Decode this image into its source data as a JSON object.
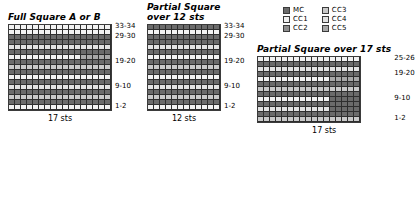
{
  "legend": {
    "name": "color-key",
    "items": [
      {
        "key": "MC",
        "label": "MC",
        "color": "#6b6b6b"
      },
      {
        "key": "CC3",
        "label": "CC3",
        "color": "#c9c9c9"
      },
      {
        "key": "CC1",
        "label": "CC1",
        "color": "#f2f2f2"
      },
      {
        "key": "CC4",
        "label": "CC4",
        "color": "#e3e3e3"
      },
      {
        "key": "CC2",
        "label": "CC2",
        "color": "#8f8f8f"
      },
      {
        "key": "CC5",
        "label": "CC5",
        "color": "#a8a8a8"
      }
    ]
  },
  "palette": {
    "MC": "#6b6b6b",
    "CC1": "#f2f2f2",
    "CC2": "#8f8f8f",
    "CC3": "#c9c9c9",
    "CC4": "#e3e3e3",
    "CC5": "#a8a8a8",
    "grid_line": "#2e2e2e",
    "border": "#3b3b3b",
    "background": "#ffffff"
  },
  "charts": [
    {
      "id": "full-square",
      "title": "Full Square A  or  B",
      "stitches_label": "17 sts",
      "stitch_count": 17,
      "row_count": 34,
      "row_labels": [
        {
          "text": "33-34",
          "row_from_top": 1
        },
        {
          "text": "29-30",
          "row_from_top": 3
        },
        {
          "text": "19-20",
          "row_from_top": 8
        },
        {
          "text": "9-10",
          "row_from_top": 13
        },
        {
          "text": "1-2",
          "row_from_top": 17
        }
      ],
      "rows": [
        [
          "CC1",
          "CC1",
          "CC1",
          "CC1",
          "CC1",
          "CC1",
          "CC1",
          "CC1",
          "CC1",
          "CC1",
          "CC1",
          "CC1",
          "CC1",
          "CC1",
          "CC1",
          "CC1",
          "CC1"
        ],
        [
          "CC1",
          "CC1",
          "CC1",
          "CC1",
          "CC1",
          "CC1",
          "CC1",
          "CC1",
          "CC1",
          "CC1",
          "CC1",
          "CC1",
          "CC1",
          "CC1",
          "CC1",
          "CC1",
          "CC1"
        ],
        [
          "MC",
          "MC",
          "MC",
          "MC",
          "MC",
          "MC",
          "MC",
          "MC",
          "MC",
          "MC",
          "MC",
          "MC",
          "MC",
          "MC",
          "MC",
          "MC",
          "MC"
        ],
        [
          "MC",
          "MC",
          "MC",
          "MC",
          "MC",
          "MC",
          "MC",
          "MC",
          "MC",
          "MC",
          "MC",
          "MC",
          "MC",
          "MC",
          "MC",
          "MC",
          "MC"
        ],
        [
          "CC4",
          "CC4",
          "CC4",
          "CC4",
          "CC4",
          "CC4",
          "CC4",
          "CC4",
          "CC4",
          "CC4",
          "CC4",
          "CC4",
          "CC4",
          "CC4",
          "CC4",
          "CC4",
          "CC4"
        ],
        [
          "MC",
          "MC",
          "MC",
          "MC",
          "MC",
          "MC",
          "MC",
          "MC",
          "MC",
          "MC",
          "MC",
          "MC",
          "MC",
          "MC",
          "MC",
          "MC",
          "MC"
        ],
        [
          "CC1",
          "CC1",
          "CC1",
          "CC1",
          "CC1",
          "CC1",
          "CC1",
          "CC1",
          "CC1",
          "CC1",
          "CC1",
          "CC1",
          "CC5",
          "CC5",
          "CC5",
          "CC5",
          "CC5"
        ],
        [
          "MC",
          "MC",
          "MC",
          "MC",
          "MC",
          "MC",
          "MC",
          "MC",
          "MC",
          "MC",
          "MC",
          "MC",
          "MC",
          "MC",
          "MC",
          "MC",
          "MC"
        ],
        [
          "CC3",
          "CC3",
          "CC3",
          "CC3",
          "CC3",
          "CC3",
          "CC3",
          "CC3",
          "CC3",
          "CC3",
          "CC3",
          "CC3",
          "CC3",
          "CC3",
          "CC3",
          "CC3",
          "CC3"
        ],
        [
          "MC",
          "MC",
          "MC",
          "MC",
          "MC",
          "MC",
          "MC",
          "MC",
          "MC",
          "MC",
          "MC",
          "MC",
          "MC",
          "MC",
          "MC",
          "MC",
          "MC"
        ],
        [
          "CC1",
          "CC1",
          "CC1",
          "CC1",
          "CC1",
          "CC1",
          "CC1",
          "CC1",
          "CC1",
          "CC1",
          "CC1",
          "CC1",
          "CC1",
          "CC1",
          "CC1",
          "CC1",
          "CC1"
        ],
        [
          "MC",
          "MC",
          "MC",
          "MC",
          "MC",
          "MC",
          "MC",
          "MC",
          "MC",
          "MC",
          "MC",
          "MC",
          "MC",
          "MC",
          "MC",
          "MC",
          "MC"
        ],
        [
          "CC4",
          "CC4",
          "CC4",
          "CC4",
          "CC4",
          "CC4",
          "CC4",
          "CC4",
          "CC4",
          "CC4",
          "CC4",
          "CC4",
          "CC4",
          "CC4",
          "CC4",
          "CC4",
          "CC4"
        ],
        [
          "MC",
          "MC",
          "MC",
          "MC",
          "MC",
          "MC",
          "MC",
          "MC",
          "MC",
          "MC",
          "MC",
          "MC",
          "MC",
          "MC",
          "MC",
          "MC",
          "MC"
        ],
        [
          "CC3",
          "CC3",
          "CC3",
          "CC3",
          "CC3",
          "CC3",
          "CC3",
          "CC3",
          "CC3",
          "CC3",
          "CC3",
          "CC3",
          "CC3",
          "CC3",
          "CC3",
          "CC3",
          "CC3"
        ],
        [
          "MC",
          "MC",
          "MC",
          "MC",
          "MC",
          "MC",
          "MC",
          "MC",
          "MC",
          "MC",
          "MC",
          "MC",
          "MC",
          "MC",
          "MC",
          "MC",
          "MC"
        ],
        [
          "CC1",
          "CC1",
          "CC1",
          "CC1",
          "CC1",
          "CC1",
          "CC1",
          "CC1",
          "CC1",
          "CC1",
          "CC1",
          "CC1",
          "CC1",
          "CC1",
          "CC1",
          "CC1",
          "CC1"
        ]
      ]
    },
    {
      "id": "partial-square-12",
      "title": "Partial Square\nover 12 sts",
      "stitches_label": "12 sts",
      "stitch_count": 12,
      "row_count": 34,
      "row_labels": [
        {
          "text": "33-34",
          "row_from_top": 1
        },
        {
          "text": "29-30",
          "row_from_top": 3
        },
        {
          "text": "19-20",
          "row_from_top": 8
        },
        {
          "text": "9-10",
          "row_from_top": 13
        },
        {
          "text": "1-2",
          "row_from_top": 17
        }
      ],
      "rows": [
        [
          "MC",
          "MC",
          "MC",
          "MC",
          "MC",
          "MC",
          "MC",
          "MC",
          "MC",
          "MC",
          "MC",
          "MC"
        ],
        [
          "CC1",
          "CC1",
          "CC1",
          "CC1",
          "CC1",
          "CC1",
          "CC1",
          "CC1",
          "CC1",
          "CC1",
          "CC1",
          "CC1"
        ],
        [
          "MC",
          "MC",
          "MC",
          "MC",
          "MC",
          "MC",
          "MC",
          "MC",
          "MC",
          "MC",
          "MC",
          "MC"
        ],
        [
          "MC",
          "MC",
          "MC",
          "MC",
          "MC",
          "MC",
          "MC",
          "MC",
          "MC",
          "MC",
          "MC",
          "MC"
        ],
        [
          "CC4",
          "CC4",
          "CC4",
          "CC4",
          "CC4",
          "CC4",
          "CC4",
          "CC4",
          "CC4",
          "CC4",
          "CC4",
          "CC4"
        ],
        [
          "MC",
          "MC",
          "MC",
          "MC",
          "MC",
          "MC",
          "MC",
          "MC",
          "MC",
          "MC",
          "MC",
          "MC"
        ],
        [
          "CC1",
          "CC1",
          "CC1",
          "CC1",
          "CC1",
          "CC1",
          "CC1",
          "CC1",
          "CC1",
          "CC1",
          "CC1",
          "CC1"
        ],
        [
          "MC",
          "MC",
          "MC",
          "MC",
          "MC",
          "MC",
          "MC",
          "MC",
          "MC",
          "MC",
          "MC",
          "MC"
        ],
        [
          "CC3",
          "CC3",
          "CC3",
          "CC3",
          "CC3",
          "CC3",
          "CC3",
          "CC3",
          "CC3",
          "CC3",
          "CC3",
          "CC3"
        ],
        [
          "MC",
          "MC",
          "MC",
          "MC",
          "MC",
          "MC",
          "MC",
          "MC",
          "MC",
          "MC",
          "MC",
          "MC"
        ],
        [
          "CC1",
          "CC1",
          "CC1",
          "CC1",
          "CC1",
          "CC1",
          "CC1",
          "CC1",
          "CC1",
          "CC1",
          "CC1",
          "CC1"
        ],
        [
          "MC",
          "MC",
          "MC",
          "MC",
          "MC",
          "MC",
          "MC",
          "MC",
          "MC",
          "MC",
          "MC",
          "MC"
        ],
        [
          "CC4",
          "CC4",
          "CC4",
          "CC4",
          "CC4",
          "CC4",
          "CC4",
          "CC4",
          "CC4",
          "CC4",
          "CC4",
          "CC4"
        ],
        [
          "MC",
          "MC",
          "MC",
          "MC",
          "MC",
          "MC",
          "MC",
          "MC",
          "MC",
          "MC",
          "MC",
          "MC"
        ],
        [
          "CC3",
          "CC3",
          "CC3",
          "CC3",
          "CC3",
          "CC3",
          "CC3",
          "CC3",
          "CC3",
          "CC3",
          "CC3",
          "CC3"
        ],
        [
          "MC",
          "MC",
          "MC",
          "MC",
          "MC",
          "MC",
          "MC",
          "MC",
          "MC",
          "MC",
          "MC",
          "MC"
        ],
        [
          "CC1",
          "CC1",
          "CC1",
          "CC1",
          "CC1",
          "CC1",
          "CC1",
          "CC1",
          "CC1",
          "CC1",
          "CC1",
          "CC1"
        ]
      ]
    },
    {
      "id": "partial-square-17",
      "title": "Partial Square over 17 sts",
      "stitches_label": "17 sts",
      "stitch_count": 17,
      "row_count": 26,
      "row_labels": [
        {
          "text": "25-26",
          "row_from_top": 1
        },
        {
          "text": "19-20",
          "row_from_top": 4
        },
        {
          "text": "9-10",
          "row_from_top": 9
        },
        {
          "text": "1-2",
          "row_from_top": 13
        }
      ],
      "rows": [
        [
          "CC1",
          "CC1",
          "CC1",
          "CC1",
          "CC1",
          "CC1",
          "CC1",
          "CC1",
          "CC1",
          "CC1",
          "CC1",
          "CC1",
          "CC1",
          "CC1",
          "CC1",
          "CC1",
          "CC1"
        ],
        [
          "MC",
          "MC",
          "MC",
          "MC",
          "MC",
          "MC",
          "MC",
          "MC",
          "MC",
          "MC",
          "MC",
          "MC",
          "MC",
          "MC",
          "MC",
          "MC",
          "MC"
        ],
        [
          "CC4",
          "CC4",
          "CC4",
          "CC4",
          "CC4",
          "CC4",
          "CC4",
          "CC4",
          "CC4",
          "CC4",
          "CC4",
          "CC4",
          "CC4",
          "CC4",
          "CC4",
          "CC4",
          "CC4"
        ],
        [
          "MC",
          "MC",
          "MC",
          "MC",
          "MC",
          "MC",
          "MC",
          "MC",
          "MC",
          "MC",
          "MC",
          "MC",
          "MC",
          "MC",
          "MC",
          "MC",
          "MC"
        ],
        [
          "CC1",
          "CC1",
          "CC1",
          "CC1",
          "CC1",
          "CC1",
          "CC1",
          "CC1",
          "CC1",
          "CC1",
          "CC1",
          "CC1",
          "CC5",
          "CC5",
          "CC5",
          "CC5",
          "CC5"
        ],
        [
          "MC",
          "MC",
          "MC",
          "MC",
          "MC",
          "MC",
          "MC",
          "MC",
          "MC",
          "MC",
          "MC",
          "MC",
          "MC",
          "MC",
          "MC",
          "MC",
          "MC"
        ],
        [
          "CC3",
          "CC3",
          "CC3",
          "CC3",
          "CC3",
          "CC3",
          "CC3",
          "CC3",
          "CC3",
          "CC3",
          "CC3",
          "CC3",
          "CC3",
          "CC3",
          "CC3",
          "CC3",
          "CC3"
        ],
        [
          "MC",
          "MC",
          "MC",
          "MC",
          "MC",
          "MC",
          "MC",
          "MC",
          "MC",
          "MC",
          "MC",
          "MC",
          "MC",
          "MC",
          "MC",
          "MC",
          "MC"
        ],
        [
          "CC1",
          "CC1",
          "CC1",
          "CC1",
          "CC1",
          "CC1",
          "CC1",
          "CC1",
          "CC1",
          "CC1",
          "CC1",
          "CC1",
          "MC",
          "MC",
          "MC",
          "MC",
          "MC"
        ],
        [
          "MC",
          "MC",
          "MC",
          "MC",
          "MC",
          "MC",
          "MC",
          "MC",
          "MC",
          "MC",
          "MC",
          "MC",
          "MC",
          "MC",
          "MC",
          "MC",
          "MC"
        ],
        [
          "CC4",
          "CC4",
          "CC4",
          "CC4",
          "CC4",
          "CC4",
          "CC4",
          "CC4",
          "CC4",
          "CC4",
          "CC4",
          "CC4",
          "MC",
          "MC",
          "MC",
          "MC",
          "MC"
        ],
        [
          "MC",
          "MC",
          "MC",
          "MC",
          "MC",
          "MC",
          "MC",
          "MC",
          "MC",
          "MC",
          "MC",
          "MC",
          "MC",
          "MC",
          "MC",
          "MC",
          "MC"
        ],
        [
          "CC3",
          "CC3",
          "CC3",
          "CC3",
          "CC3",
          "CC3",
          "CC3",
          "CC3",
          "CC3",
          "CC3",
          "CC3",
          "CC3",
          "CC3",
          "CC3",
          "CC3",
          "CC3",
          "CC3"
        ]
      ]
    }
  ]
}
